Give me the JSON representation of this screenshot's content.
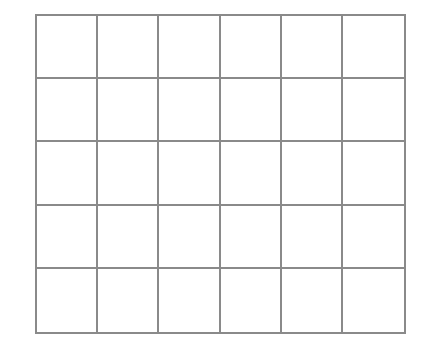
{
  "grid": {
    "rows": 5,
    "columns": 6,
    "line_color": "#8a8a8a",
    "background": "#ffffff"
  }
}
